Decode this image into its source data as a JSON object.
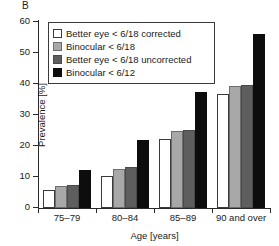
{
  "panel": {
    "label": "B"
  },
  "chart_data": {
    "type": "bar",
    "title": "",
    "xlabel": "Age [years]",
    "ylabel": "Prevalence [%]",
    "ylim": [
      0,
      60
    ],
    "yticks": [
      0,
      10,
      20,
      30,
      40,
      50,
      60
    ],
    "ytick_labels": [
      "0",
      "10",
      "20",
      "30",
      "40",
      "50",
      "60"
    ],
    "grid": false,
    "legend_position": "upper-left",
    "categories": [
      "75–79",
      "80–84",
      "85–89",
      "90 and over"
    ],
    "series": [
      {
        "name": "Better eye < 6/18 corrected",
        "color": "#ffffff",
        "values": [
          5.8,
          10.2,
          22.2,
          36.8
        ]
      },
      {
        "name": "Binocular < 6/18",
        "color": "#a8a8a8",
        "values": [
          7.0,
          12.7,
          25.0,
          39.2
        ]
      },
      {
        "name": "Better eye < 6/18 uncorrected",
        "color": "#5e5e5e",
        "values": [
          7.4,
          13.3,
          25.1,
          39.7
        ]
      },
      {
        "name": "Binocular < 6/12",
        "color": "#0d0d0d",
        "values": [
          12.2,
          22.1,
          37.3,
          56.2
        ]
      }
    ]
  }
}
